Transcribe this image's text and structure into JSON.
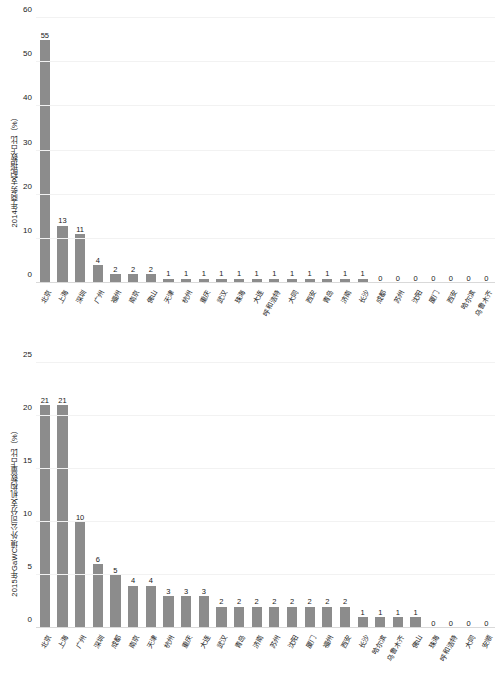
{
  "chart_data": [
    {
      "id": "chart-1",
      "type": "bar",
      "title": "",
      "xlabel": "",
      "ylabel": "2014年商务支配指数占比（%）",
      "ylim": [
        0,
        60
      ],
      "yticks": [
        0,
        10,
        20,
        30,
        40,
        50,
        60
      ],
      "grid": true,
      "legend": "none",
      "bar_color": "#8c8c8c",
      "categories": [
        "北京",
        "上海",
        "深圳",
        "广州",
        "福州",
        "南京",
        "佛山",
        "天津",
        "杭州",
        "重庆",
        "武汉",
        "珠海",
        "大连",
        "呼和浩特",
        "大同",
        "西安",
        "青岛",
        "济南",
        "长沙",
        "成都",
        "苏州",
        "沈阳",
        "厦门",
        "西安",
        "哈尔滨",
        "乌鲁木齐"
      ],
      "values": [
        55,
        13,
        11,
        4,
        2,
        2,
        2,
        1,
        1,
        1,
        1,
        1,
        1,
        1,
        1,
        1,
        1,
        1,
        1,
        0,
        0,
        0,
        0,
        0,
        0,
        0
      ],
      "value_labels": [
        "55",
        "13",
        "11",
        "4",
        "2",
        "2",
        "2",
        "1",
        "1",
        "1",
        "1",
        "1",
        "1",
        "1",
        "1",
        "1",
        "1",
        "1",
        "1",
        "0",
        "0",
        "0",
        "0",
        "0",
        "0",
        "0"
      ]
    },
    {
      "id": "chart-2",
      "type": "bar",
      "title": "",
      "xlabel": "",
      "ylabel": "2015年GaWC境外公司分支机构数量占比（%）",
      "ylim": [
        0,
        25
      ],
      "yticks": [
        0,
        5,
        10,
        15,
        20,
        25
      ],
      "grid": true,
      "legend": "none",
      "bar_color": "#8c8c8c",
      "categories": [
        "北京",
        "上海",
        "广州",
        "深圳",
        "成都",
        "南京",
        "天津",
        "杭州",
        "重庆",
        "大连",
        "武汉",
        "青岛",
        "济南",
        "苏州",
        "沈阳",
        "厦门",
        "福州",
        "西安",
        "长沙",
        "哈尔滨",
        "乌鲁木齐",
        "佛山",
        "珠海",
        "呼和浩特",
        "大同",
        "安顺"
      ],
      "values": [
        21,
        21,
        10,
        6,
        5,
        4,
        4,
        3,
        3,
        3,
        2,
        2,
        2,
        2,
        2,
        2,
        2,
        2,
        1,
        1,
        1,
        1,
        0,
        0,
        0,
        0
      ],
      "value_labels": [
        "21",
        "21",
        "10",
        "6",
        "5",
        "4",
        "4",
        "3",
        "3",
        "3",
        "2",
        "2",
        "2",
        "2",
        "2",
        "2",
        "2",
        "2",
        "1",
        "1",
        "1",
        "1",
        "0",
        "0",
        "0",
        "0"
      ]
    }
  ]
}
